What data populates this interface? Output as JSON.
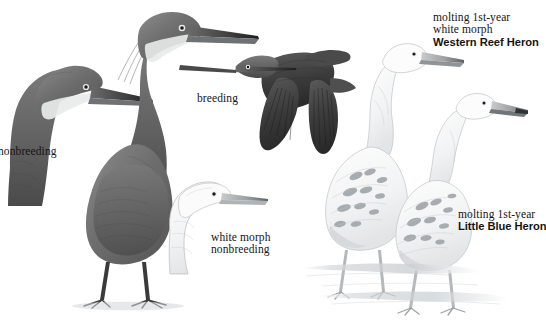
{
  "plate": {
    "title": "Western Reef Heron and Little Blue Heron plate",
    "background": "#ffffff",
    "width": 546,
    "height": 320,
    "ink_dark": "#4a4a4a",
    "ink_text": "#161412",
    "ink_light": "#b9bcbe"
  },
  "labels": {
    "nonbreeding": "nonbreeding",
    "breeding": "breeding",
    "white_morph": "white morph",
    "white_morph_nonbreeding": "nonbreeding",
    "molting_first_year": "molting 1st-year",
    "white_morph_top": "white morph",
    "species_reef": "Western Reef Heron",
    "molting_first_year_2": "molting 1st-year",
    "species_little_blue": "Little Blue Heron"
  },
  "figures": [
    {
      "name": "dark-morph-nonbreeding-head",
      "description": "dark morph nonbreeding head and neck, pale throat stripe, long dagger bill",
      "label": "nonbreeding"
    },
    {
      "name": "dark-morph-breeding-standing-bird",
      "description": "full standing dark morph breeding adult with head plumes and long legs",
      "label": "breeding"
    },
    {
      "name": "dark-morph-flight-bird",
      "description": "dark heron in flight, wings down, neck tucked",
      "label": "breeding"
    },
    {
      "name": "white-morph-nonbreeding-head",
      "description": "pale white morph nonbreeding head outline with gray bill",
      "label": "white morph nonbreeding"
    },
    {
      "name": "molting-first-year-white-morph-reef-heron",
      "description": "standing white bird with scattered dark molt feathers, long neck",
      "label": "molting 1st-year white morph Western Reef Heron"
    },
    {
      "name": "molting-first-year-little-blue-heron",
      "description": "standing white bird with dark mottling, shorter bill, hunched neck",
      "label": "molting 1st-year Little Blue Heron"
    }
  ]
}
